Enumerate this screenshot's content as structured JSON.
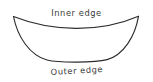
{
  "figure": {
    "background_color": "#ffffff",
    "stroke_color": "#2c2c2c",
    "text_color": "#3a3a3a",
    "width": 153,
    "height": 82,
    "labels": {
      "inner": "Inner edge",
      "outer": "Outer edge"
    },
    "shape": {
      "name": "crescent",
      "left_tip": "13,16",
      "right_tip": "139,16",
      "inner_curve_lowest_y": 27,
      "outer_curve_lowest_y": 61,
      "filled": false
    }
  }
}
